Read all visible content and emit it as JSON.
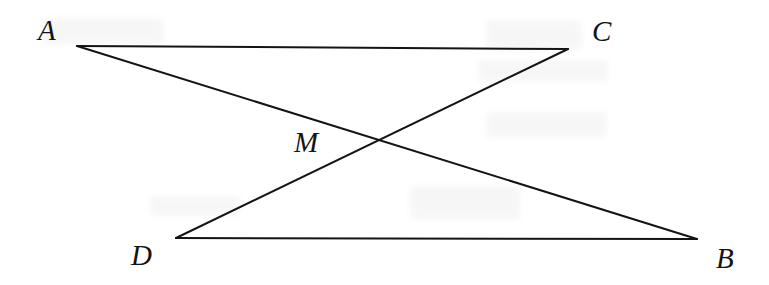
{
  "figure": {
    "background_color": "#ffffff",
    "stroke_color": "#141414",
    "stroke_width": 2,
    "label_color": "#141414",
    "width": 769,
    "height": 285,
    "points": [
      {
        "id": "A",
        "label": "A",
        "x": 77,
        "y": 46,
        "label_x": 38,
        "label_y": 16
      },
      {
        "id": "C",
        "label": "C",
        "x": 568,
        "y": 49,
        "label_x": 592,
        "label_y": 17
      },
      {
        "id": "M",
        "label": "M",
        "x": 378,
        "y": 140,
        "label_x": 294,
        "label_y": 128
      },
      {
        "id": "D",
        "label": "D",
        "x": 176,
        "y": 238,
        "label_x": 131,
        "label_y": 241
      },
      {
        "id": "B",
        "label": "B",
        "x": 697,
        "y": 239,
        "label_x": 716,
        "label_y": 244
      }
    ],
    "segments": [
      {
        "id": "AC",
        "from": "A",
        "to": "C",
        "name": "segment-ac"
      },
      {
        "id": "DB",
        "from": "D",
        "to": "B",
        "name": "segment-db"
      },
      {
        "id": "AB",
        "from": "A",
        "to": "B",
        "name": "segment-ab"
      },
      {
        "id": "DC",
        "from": "D",
        "to": "C",
        "name": "segment-dc"
      }
    ],
    "smudges": [
      {
        "x": 44,
        "y": 18,
        "w": 120,
        "h": 26
      },
      {
        "x": 486,
        "y": 20,
        "w": 96,
        "h": 30
      },
      {
        "x": 478,
        "y": 60,
        "w": 130,
        "h": 22
      },
      {
        "x": 410,
        "y": 186,
        "w": 110,
        "h": 34
      },
      {
        "x": 486,
        "y": 112,
        "w": 120,
        "h": 26
      },
      {
        "x": 150,
        "y": 196,
        "w": 90,
        "h": 20
      }
    ]
  }
}
